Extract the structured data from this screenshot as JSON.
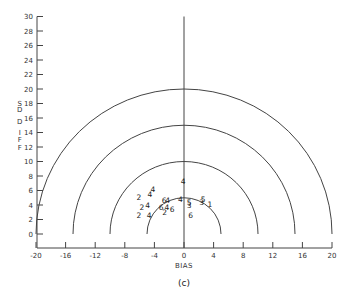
{
  "chart_data": {
    "type": "scatter",
    "title": "",
    "caption": "(c)",
    "xlabel": "BIAS",
    "ylabel": "SD DIFF",
    "ylabel_letters": [
      "S",
      "D",
      "D",
      "I",
      "F",
      "F"
    ],
    "xlim": [
      -20,
      20
    ],
    "ylim": [
      0,
      30
    ],
    "x_ticks": [
      -20,
      -16,
      -12,
      -8,
      -4,
      0,
      4,
      8,
      12,
      16,
      20
    ],
    "x_tick_labels": [
      "-20",
      "-16",
      "-12",
      "-8",
      "-4",
      "0",
      "4",
      "8",
      "12",
      "16",
      "20"
    ],
    "y_ticks": [
      0,
      2,
      4,
      6,
      8,
      10,
      12,
      14,
      16,
      18,
      20,
      22,
      24,
      26,
      28,
      30
    ],
    "y_tick_labels": [
      "0",
      "2",
      "4",
      "6",
      "8",
      "10",
      "12",
      "14",
      "16",
      "18",
      "20",
      "22",
      "24",
      "26",
      "28",
      "30"
    ],
    "grid": false,
    "reference_semicircles": {
      "center": [
        0,
        0
      ],
      "radii": [
        5,
        10,
        15,
        20
      ]
    },
    "reference_vertical_line_x": 0,
    "points": [
      {
        "label": "4",
        "x": -4.2,
        "y": 6.2
      },
      {
        "label": "2",
        "x": -6.1,
        "y": 5.1
      },
      {
        "label": "4",
        "x": -4.6,
        "y": 5.4
      },
      {
        "label": "2",
        "x": -5.7,
        "y": 3.7
      },
      {
        "label": "4",
        "x": -4.9,
        "y": 4.0
      },
      {
        "label": "2",
        "x": -6.1,
        "y": 2.6
      },
      {
        "label": "4",
        "x": -4.7,
        "y": 2.5
      },
      {
        "label": "6",
        "x": -2.7,
        "y": 4.6
      },
      {
        "label": "4",
        "x": -2.2,
        "y": 4.6
      },
      {
        "label": "6",
        "x": -3.1,
        "y": 3.6
      },
      {
        "label": "4",
        "x": -2.3,
        "y": 3.7
      },
      {
        "label": "6",
        "x": -1.6,
        "y": 3.4
      },
      {
        "label": "2",
        "x": -2.6,
        "y": 2.9
      },
      {
        "label": "4",
        "x": -0.5,
        "y": 4.7
      },
      {
        "label": "4",
        "x": -0.1,
        "y": 7.2
      },
      {
        "label": "5",
        "x": 0.7,
        "y": 4.3
      },
      {
        "label": "3",
        "x": 0.7,
        "y": 4.0
      },
      {
        "label": "6",
        "x": 0.9,
        "y": 2.5
      },
      {
        "label": "5",
        "x": 2.6,
        "y": 4.8
      },
      {
        "label": "3",
        "x": 2.4,
        "y": 4.4
      },
      {
        "label": "1",
        "x": 3.5,
        "y": 4.1
      }
    ]
  },
  "colors": {
    "ink": "#333333",
    "background": "#ffffff"
  }
}
